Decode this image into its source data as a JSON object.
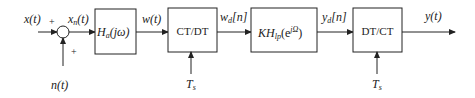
{
  "diagram": {
    "type": "signal-processing block diagram",
    "signals": {
      "input": "x(t)",
      "noise": "n(t)",
      "noisy_input": {
        "base": "x",
        "sub": "n",
        "arg": "(t)"
      },
      "prefilter_output": "w(t)",
      "sampled": {
        "base": "w",
        "sub": "d",
        "arg": "[n]"
      },
      "filtered": {
        "base": "y",
        "sub": "d",
        "arg": "[n]"
      },
      "output": "y(t)"
    },
    "summing_junction": {
      "plus_top": "+",
      "plus_bottom": "+"
    },
    "blocks": [
      {
        "id": "antialias",
        "base": "H",
        "sub": "a",
        "arg": "(jω)"
      },
      {
        "id": "ctdt",
        "label": "CT/DT"
      },
      {
        "id": "dtfilter",
        "base": "KH",
        "sub": "lp",
        "arg_open": "(e",
        "sup": "jΩ",
        "arg_close": ")"
      },
      {
        "id": "dtct",
        "label": "DT/CT"
      }
    ],
    "sampling_period": {
      "base": "T",
      "sub": "s"
    }
  }
}
